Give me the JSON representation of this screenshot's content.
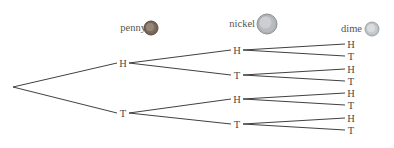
{
  "diagram": {
    "type": "probability-tree",
    "root": {
      "x": 13,
      "y": 87
    },
    "levels": [
      {
        "coin": "penny",
        "label_pos": {
          "x": 146,
          "y": 31
        },
        "coin_icon": {
          "cx": 151,
          "cy": 28,
          "r": 7,
          "fill": "#7d6b5e",
          "stroke": "#5a4c42",
          "inner": "#a8998a"
        },
        "nodes": [
          {
            "label": "H",
            "x": 123,
            "y": 63,
            "parent": "root"
          },
          {
            "label": "T",
            "x": 123,
            "y": 113,
            "parent": "root"
          }
        ]
      },
      {
        "coin": "nickel",
        "label_pos": {
          "x": 248,
          "y": 27
        },
        "coin_icon": {
          "cx": 267,
          "cy": 24,
          "r": 10,
          "fill": "#b8bcc0",
          "stroke": "#8d9195",
          "inner": "#d7dadd"
        },
        "nodes": [
          {
            "label": "H",
            "x": 237,
            "y": 50,
            "parent": 0
          },
          {
            "label": "T",
            "x": 237,
            "y": 75,
            "parent": 0
          },
          {
            "label": "H",
            "x": 237,
            "y": 99,
            "parent": 1
          },
          {
            "label": "T",
            "x": 237,
            "y": 124,
            "parent": 1
          }
        ]
      },
      {
        "coin": "dime",
        "label_pos": {
          "x": 355,
          "y": 32
        },
        "coin_icon": {
          "cx": 372,
          "cy": 29,
          "r": 7,
          "fill": "#c8cbce",
          "stroke": "#9da1a5",
          "inner": "#e6e8ea"
        },
        "nodes": [
          {
            "label": "H",
            "x": 351,
            "y": 44,
            "parent": 0
          },
          {
            "label": "T",
            "x": 351,
            "y": 56,
            "parent": 0
          },
          {
            "label": "H",
            "x": 351,
            "y": 69,
            "parent": 1
          },
          {
            "label": "T",
            "x": 351,
            "y": 81,
            "parent": 1
          },
          {
            "label": "H",
            "x": 351,
            "y": 93,
            "parent": 2
          },
          {
            "label": "T",
            "x": 351,
            "y": 105,
            "parent": 2
          },
          {
            "label": "H",
            "x": 351,
            "y": 118,
            "parent": 3
          },
          {
            "label": "T",
            "x": 351,
            "y": 130,
            "parent": 3
          }
        ]
      }
    ]
  },
  "labels": {
    "penny": "penny",
    "nickel": "nickel",
    "dime": "dime",
    "heads": "H",
    "tails": "T"
  },
  "colors": {
    "line": "#2a2a2a",
    "text": "#4a4a4a",
    "background": "#ffffff"
  }
}
